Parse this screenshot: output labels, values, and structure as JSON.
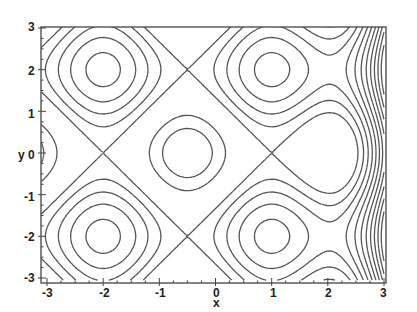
{
  "chart_data": {
    "type": "contour",
    "title": "",
    "xlabel": "x",
    "ylabel": "y",
    "xlim": [
      -3,
      3
    ],
    "ylim": [
      -3,
      3
    ],
    "x_ticks": [
      "-3",
      "-2",
      "-1",
      "0",
      "1",
      "2",
      "3"
    ],
    "y_ticks": [
      "3",
      "2",
      "1",
      "0",
      "-1",
      "-2",
      "-3"
    ],
    "grid": false,
    "legend": null,
    "features": {
      "minimum": [
        -0.5,
        0
      ],
      "saddles": [
        [
          -2,
          2
        ],
        [
          -2,
          -2
        ],
        [
          1,
          2
        ],
        [
          1,
          -2
        ]
      ],
      "separatrix_x": [
        -2,
        1
      ],
      "separatrix_y": [
        -2,
        2
      ],
      "steep_region": "right edge (x near 3) has densely packed contours"
    },
    "model": {
      "x_center": -0.5,
      "x_halfperiod": 1.5,
      "y_halfperiod": 2.0,
      "right_growth": 0.55,
      "levels": [
        -1.6,
        -1.15,
        0.0,
        0.45,
        0.9,
        1.35,
        1.8,
        2.25,
        2.7,
        3.15,
        3.6,
        4.05,
        4.5,
        4.95,
        5.4,
        5.85,
        6.3,
        6.75,
        7.2,
        7.65
      ]
    },
    "line_color": "#555555"
  }
}
